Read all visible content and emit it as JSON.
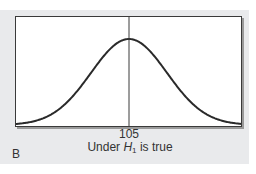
{
  "figure": {
    "panel_label": "B",
    "x_tick_label": "105",
    "caption": {
      "prefix": "Under ",
      "symbol": "H",
      "subscript": "1",
      "suffix": " is true"
    }
  },
  "colors": {
    "panel_background": "#e9eaec",
    "plot_background": "#ffffff",
    "curve": "#2a2a2a",
    "text": "#333333"
  },
  "chart_data": {
    "type": "line",
    "title": "",
    "xlabel": "Under H1 is true",
    "ylabel": "",
    "x_ticks": [
      "105"
    ],
    "mean": 105,
    "vertical_line_at": 105,
    "grid": false,
    "legend": null
  }
}
